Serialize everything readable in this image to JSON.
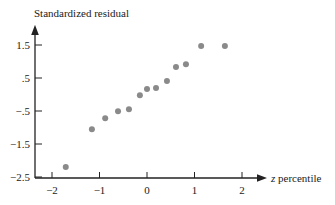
{
  "chart_data": {
    "type": "scatter",
    "title": "",
    "xlabel": "z percentile",
    "ylabel": "Standardized residual",
    "xlim": [
      -2.3,
      2.6
    ],
    "ylim": [
      -2.5,
      1.9
    ],
    "x_ticks": [
      -2,
      -1,
      0,
      1,
      2
    ],
    "x_tick_labels": [
      "−2",
      "−1",
      "0",
      "1",
      "2"
    ],
    "y_ticks": [
      1.5,
      0.5,
      -0.5,
      -1.5,
      -2.5
    ],
    "y_tick_labels": [
      "1.5",
      ".5",
      "−.5",
      "−1.5",
      "−2.5"
    ],
    "grid": false,
    "legend": null,
    "point_color": "#8a8a8a",
    "series": [
      {
        "name": "residuals",
        "points": [
          {
            "x": -1.71,
            "y": -2.2
          },
          {
            "x": -1.16,
            "y": -1.05
          },
          {
            "x": -0.88,
            "y": -0.72
          },
          {
            "x": -0.61,
            "y": -0.51
          },
          {
            "x": -0.38,
            "y": -0.45
          },
          {
            "x": -0.15,
            "y": -0.02
          },
          {
            "x": 0.0,
            "y": 0.17
          },
          {
            "x": 0.19,
            "y": 0.2
          },
          {
            "x": 0.42,
            "y": 0.41
          },
          {
            "x": 0.61,
            "y": 0.83
          },
          {
            "x": 0.82,
            "y": 0.92
          },
          {
            "x": 1.14,
            "y": 1.47
          },
          {
            "x": 1.64,
            "y": 1.47
          }
        ]
      }
    ]
  }
}
